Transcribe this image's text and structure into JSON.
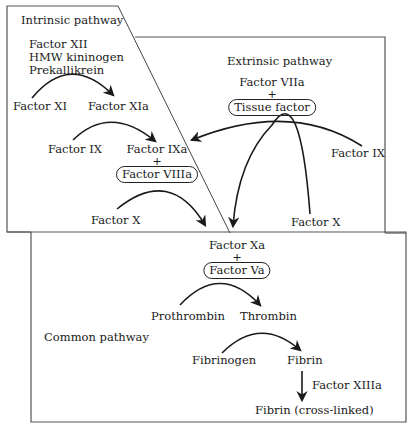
{
  "sections": {
    "intrinsic": {
      "label": "Intrinsic pathway",
      "initiators": [
        "Factor XII",
        "HMW kininogen",
        "Prekallikrein"
      ],
      "step1": {
        "from": "Factor XI",
        "to": "Factor XIa"
      },
      "step2": {
        "from": "Factor IX",
        "to": "Factor IXa",
        "plus": "+",
        "cofactor": "Factor VIIIa"
      },
      "step3": {
        "from": "Factor X"
      }
    },
    "extrinsic": {
      "label": "Extrinsic pathway",
      "enzyme": "Factor VIIa",
      "plus": "+",
      "cofactor": "Tissue factor",
      "substrate_ix": "Factor IX",
      "substrate_x": "Factor X"
    },
    "common": {
      "label": "Common pathway",
      "enzyme": "Factor Xa",
      "plus": "+",
      "cofactor": "Factor Va",
      "step1": {
        "from": "Prothrombin",
        "to": "Thrombin"
      },
      "step2": {
        "from": "Fibrinogen",
        "to": "Fibrin"
      },
      "step3": {
        "enzyme": "Factor XIIIa",
        "to": "Fibrin (cross-linked)"
      }
    }
  },
  "colors": {
    "line": "#222222",
    "border": "#555555",
    "background": "#ffffff"
  }
}
